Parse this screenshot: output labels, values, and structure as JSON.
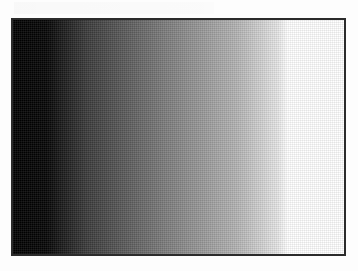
{
  "figure": {
    "type": "grayscale-gradient-ramp",
    "direction": "left-to-right",
    "colors": {
      "start": "#000000",
      "end": "#ffffff",
      "border": "#2b2b2b",
      "background": "#fdfdfd"
    },
    "stops": [
      {
        "color": "#000000",
        "pos": "0%"
      },
      {
        "color": "#050505",
        "pos": "10%"
      },
      {
        "color": "#3a3a3a",
        "pos": "22%"
      },
      {
        "color": "#7a7a7a",
        "pos": "45%"
      },
      {
        "color": "#b5b5b5",
        "pos": "68%"
      },
      {
        "color": "#e6e6e6",
        "pos": "80%"
      },
      {
        "color": "#ffffff",
        "pos": "83%"
      },
      {
        "color": "#ffffff",
        "pos": "100%"
      }
    ]
  }
}
